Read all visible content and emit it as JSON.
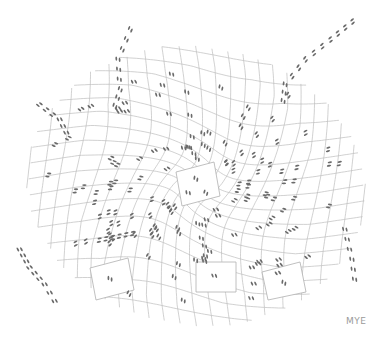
{
  "illustration": {
    "signature": "MYE",
    "line_color": "#b8b8b8",
    "footprint_color": "#6a6a6a",
    "center": [
      196,
      186
    ],
    "central_panel": {
      "corners": [
        [
          176,
          172
        ],
        [
          214,
          162
        ],
        [
          220,
          196
        ],
        [
          182,
          206
        ]
      ]
    },
    "loose_panels": [
      [
        [
          90,
          268
        ],
        [
          128,
          258
        ],
        [
          134,
          290
        ],
        [
          96,
          300
        ]
      ],
      [
        [
          196,
          262
        ],
        [
          236,
          262
        ],
        [
          236,
          292
        ],
        [
          196,
          292
        ]
      ],
      [
        [
          262,
          272
        ],
        [
          300,
          262
        ],
        [
          306,
          292
        ],
        [
          268,
          300
        ]
      ]
    ]
  }
}
